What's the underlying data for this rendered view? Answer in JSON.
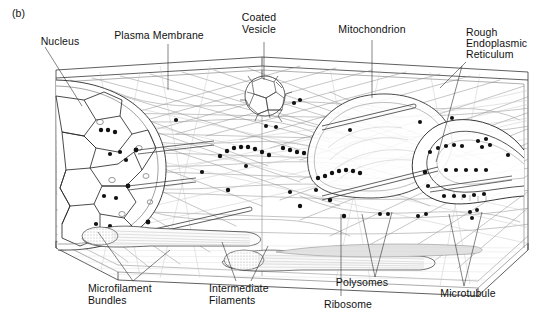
{
  "figure": {
    "panel_label": "(b)",
    "background_color": "#ffffff",
    "ink_color": "#1a1a1a",
    "faint_ink_color": "#9a9a9a",
    "width": 543,
    "height": 324
  },
  "labels": {
    "nucleus": "Nucleus",
    "plasma_membrane": "Plasma Membrane",
    "coated_vesicle_l1": "Coated",
    "coated_vesicle_l2": "Vesicle",
    "mitochondrion": "Mitochondrion",
    "rough_er_l1": "Rough",
    "rough_er_l2": "Endoplasmic",
    "rough_er_l3": "Reticulum",
    "microfilament_l1": "Microfilament",
    "microfilament_l2": "Bundles",
    "intermediate_l1": "Intermediate",
    "intermediate_l2": "Filaments",
    "ribosome": "Ribosome",
    "polysomes": "Polysomes",
    "microtubule": "Microtubule"
  },
  "callouts": [
    {
      "name": "nucleus",
      "text": "Nucleus",
      "x": 60,
      "y": 42,
      "anchor_x": 82,
      "anchor_y": 106
    },
    {
      "name": "plasma-membrane",
      "text": "Plasma Membrane",
      "x": 159,
      "y": 36,
      "anchor_x": 168,
      "anchor_y": 90
    },
    {
      "name": "coated-vesicle",
      "text": "Coated Vesicle",
      "x": 259,
      "y": 22,
      "anchor_x": 264,
      "anchor_y": 80
    },
    {
      "name": "mitochondrion",
      "text": "Mitochondrion",
      "x": 372,
      "y": 30,
      "anchor_x": 372,
      "anchor_y": 95
    },
    {
      "name": "rough-er",
      "text": "Rough Endoplasmic Reticulum",
      "x": 466,
      "y": 32,
      "anchor_x": 438,
      "anchor_y": 160
    },
    {
      "name": "microfilament-bundles",
      "text": "Microfilament Bundles",
      "x": 88,
      "y": 287,
      "anchor_x": 133,
      "anchor_y": 283
    },
    {
      "name": "intermediate-filaments",
      "text": "Intermediate Filaments",
      "x": 212,
      "y": 287,
      "anchor_x": 236,
      "anchor_y": 270
    },
    {
      "name": "ribosome",
      "text": "Ribosome",
      "x": 320,
      "y": 303,
      "anchor_x": 341,
      "anchor_y": 220
    },
    {
      "name": "polysomes",
      "text": "Polysomes",
      "x": 362,
      "y": 284,
      "anchor_x": 375,
      "anchor_y": 215
    },
    {
      "name": "microtubule",
      "text": "Microtubule",
      "x": 447,
      "y": 294,
      "anchor_x": 464,
      "anchor_y": 218
    }
  ],
  "structures": {
    "nucleus_note": "Large fractured sphere at left with nuclear pores",
    "coated_vesicle_note": "Polyhedral clathrin cage near top centre",
    "mitochondrion_note": "Elongated ovoid in upper right-centre",
    "rough_er_note": "Folded cisterna studded with ribosomes at right",
    "polysome_note": "Arc-shaped chains of dark ribosome dots",
    "microfilament_note": "Flat stippled bundles along the cell floor"
  }
}
